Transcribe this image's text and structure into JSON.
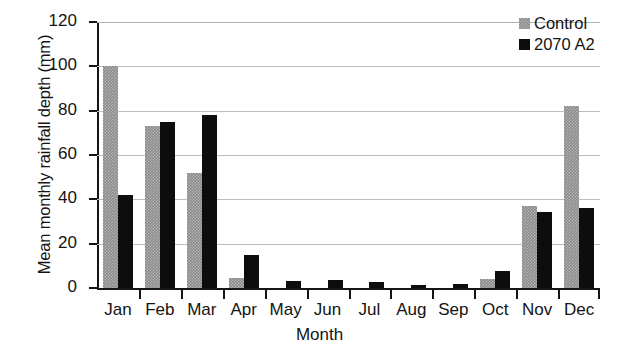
{
  "chart_data": {
    "type": "bar",
    "title": "",
    "xlabel": "Month",
    "ylabel": "Mean monthly rainfall depth (mm)",
    "categories": [
      "Jan",
      "Feb",
      "Mar",
      "Apr",
      "May",
      "Jun",
      "Jul",
      "Aug",
      "Sep",
      "Oct",
      "Nov",
      "Dec"
    ],
    "series": [
      {
        "name": "Control",
        "color": "#8c8c8c",
        "values": [
          100,
          73,
          52,
          4.5,
          0,
          0,
          0,
          0,
          0,
          4,
          37,
          82
        ]
      },
      {
        "name": "2070 A2",
        "color": "#0d0d0d",
        "values": [
          42,
          75,
          78,
          15,
          3,
          3.5,
          2.5,
          1.5,
          1.8,
          7.5,
          34.5,
          36
        ]
      }
    ],
    "ylim": [
      0,
      120
    ],
    "yticks": [
      0,
      20,
      40,
      60,
      80,
      100,
      120
    ],
    "ytick_labels": [
      "0",
      "20",
      "40",
      "60",
      "80",
      "100",
      "120"
    ],
    "grid": true,
    "legend_position": "top-right"
  },
  "legend": {
    "entries": [
      {
        "label": "Control",
        "swatch": "gray-square-icon"
      },
      {
        "label": "2070 A2",
        "swatch": "black-square-icon"
      }
    ]
  }
}
